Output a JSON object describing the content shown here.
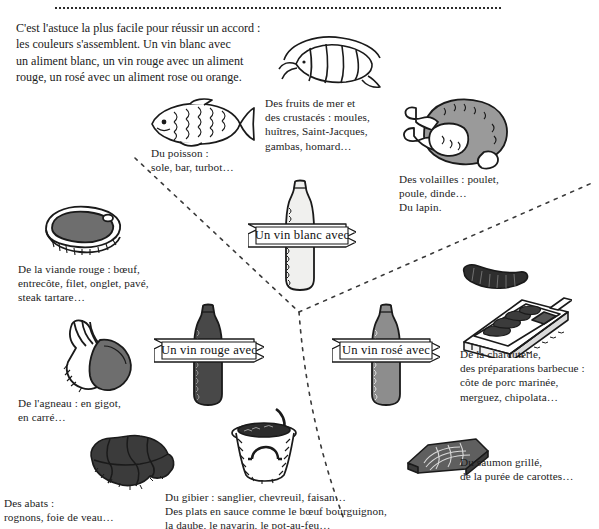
{
  "page": {
    "background": "#ffffff",
    "ink": "#1a1a1a"
  },
  "intro": {
    "text": "C'est l'astuce la plus facile pour réussir un accord :\nles couleurs s'assemblent. Un vin blanc avec\nun aliment blanc, un vin rouge avec un aliment\nrouge, un rosé avec un aliment rose ou orange."
  },
  "banners": {
    "white": "Un vin blanc avec",
    "red": "Un vin rouge avec",
    "rose": "Un vin rosé avec"
  },
  "captions": {
    "poisson": "Du poisson :\nsole, bar, turbot…",
    "fruits_de_mer": "Des fruits de mer et\ndes crustacés : moules,\nhuîtres, Saint-Jacques,\ngambas, homard…",
    "volailles": "Des volailles : poulet,\npoule, dinde…\nDu lapin.",
    "viande_rouge": "De la viande rouge : bœuf,\nentrecôte, filet, onglet, pavé,\nsteak tartare…",
    "agneau": "De l'agneau : en gigot,\nen carré…",
    "abats": "Des abats :\nrognons, foie de veau…",
    "gibier": "Du gibier : sanglier, chevreuil, faisan…\nDes plats en sauce comme le bœuf bourguignon,\nla daube, le navarin, le pot-au-feu…",
    "charcuterie": "De la charcuterie,\ndes préparations barbecue :\ncôte de porc marinée,\nmerguez, chipolata…",
    "saumon": "Du saumon grillé,\nde la purée de carottes…"
  },
  "illustrations": {
    "shrimp": "shrimp-illustration",
    "fish": "fish-illustration",
    "poultry": "poultry-illustration",
    "steak": "steak-illustration",
    "lamb": "lamb-leg-illustration",
    "offal": "offal-illustration",
    "stewpot": "stew-pot-illustration",
    "sausage": "sausage-illustration",
    "grill": "barbecue-grill-illustration",
    "salmon": "salmon-fillet-illustration",
    "bottle_white": "white-wine-bottle-illustration",
    "bottle_red": "red-wine-bottle-illustration",
    "bottle_rose": "rose-wine-bottle-illustration"
  },
  "colors": {
    "ink": "#1a1a1a",
    "bottle_white_fill": "#f0f0ee",
    "bottle_red_fill": "#4a4a4a",
    "bottle_rose_fill": "#8a8a8a",
    "meat_fill": "#6e6e6e",
    "dark_fill": "#3b3b3b",
    "divider": "#3a3a3a"
  }
}
